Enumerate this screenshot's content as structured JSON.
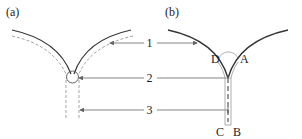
{
  "panels": {
    "a": {
      "label": "(a)"
    },
    "b": {
      "label": "(b)"
    }
  },
  "callouts": [
    {
      "number": "1"
    },
    {
      "number": "2"
    },
    {
      "number": "3"
    }
  ],
  "points": {
    "D": "D",
    "A": "A",
    "C": "C",
    "B": "B"
  },
  "colors": {
    "solid": "#333333",
    "dashed": "#999999",
    "leader": "#666666"
  }
}
